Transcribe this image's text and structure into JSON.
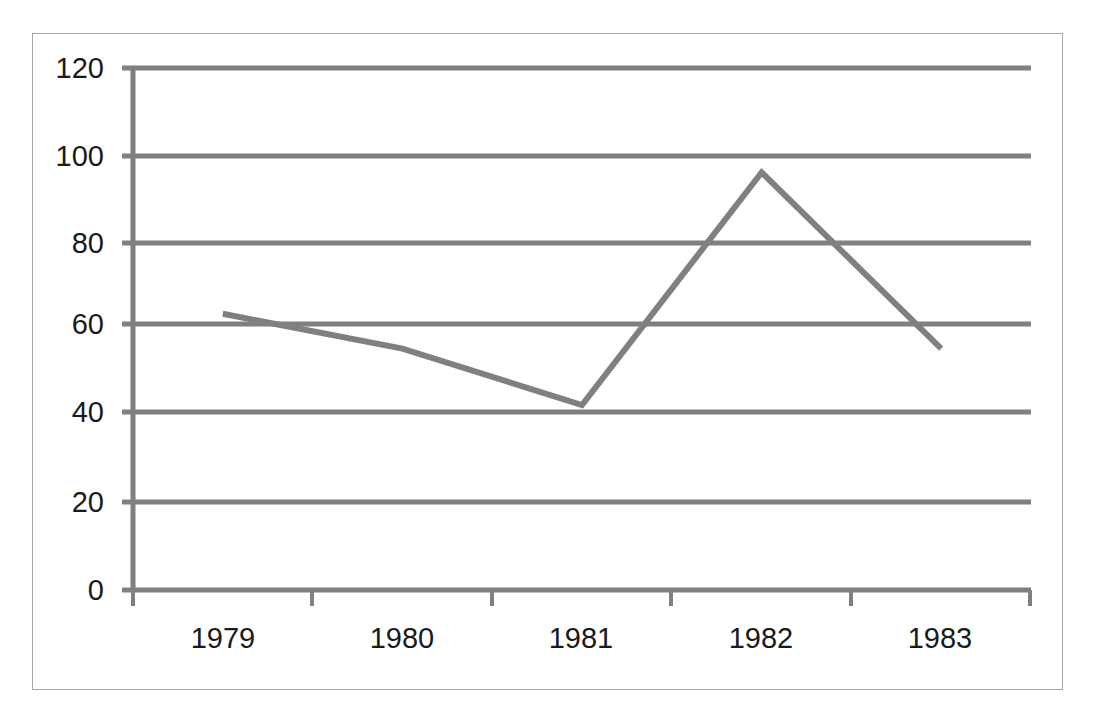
{
  "chart_data": {
    "type": "line",
    "title": "",
    "subtitle": "",
    "xlabel": "",
    "ylabel": "",
    "categories": [
      "1979",
      "1980",
      "1981",
      "1982",
      "1983"
    ],
    "series": [
      {
        "name": "Series 1",
        "values": [
          63.5,
          55.5,
          42.5,
          96,
          55.5
        ],
        "color": "#808080",
        "line_width": 6
      }
    ],
    "ylim": [
      0,
      120
    ],
    "y_ticks": [
      0,
      20,
      40,
      60,
      80,
      100,
      120
    ],
    "y_tick_labels": [
      "0",
      "20",
      "40",
      "60",
      "80",
      "100",
      "120"
    ],
    "x_tick_labels": [
      "1979",
      "1980",
      "1981",
      "1982",
      "1983"
    ],
    "grid": {
      "horizontal": true,
      "vertical": false,
      "color": "#808080"
    },
    "legend": {
      "visible": false,
      "position": "none"
    },
    "axis": {
      "color": "#808080",
      "tick_marks": true,
      "border_color": "#a6a6a6"
    },
    "markers": false,
    "background": "#ffffff"
  },
  "frame": {
    "border_color": "#a6a6a6"
  }
}
